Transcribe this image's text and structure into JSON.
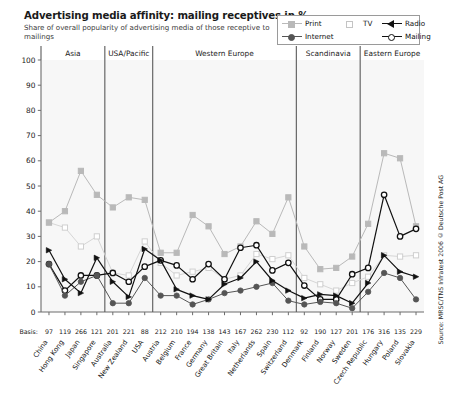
{
  "header": {
    "title": "Advertising media affinity: mailing receptives in %",
    "subtitle": "Share of overall popularity of advertising media of those receptive to mailings"
  },
  "source": "Source: MRSC/TNS Infratest 2006 © Deutsche Post AG",
  "basis_title": "Basis:",
  "legend": {
    "items": [
      {
        "label": "Print",
        "color": "#b9b9b9",
        "marker": "square",
        "filled": true
      },
      {
        "label": "TV",
        "color": "#d6d6d6",
        "marker": "square",
        "filled": false
      },
      {
        "label": "Radio",
        "color": "#111111",
        "marker": "triangle",
        "filled": true
      },
      {
        "label": "Internet",
        "color": "#555555",
        "marker": "circle",
        "filled": true
      },
      {
        "label": "Mailing",
        "color": "#111111",
        "marker": "circle",
        "filled": false
      }
    ]
  },
  "chart_data": {
    "type": "line",
    "title": "Advertising media affinity: mailing receptives in %",
    "subtitle": "Share of overall popularity of advertising media of those receptive to mailings",
    "xlabel": "",
    "ylabel": "",
    "ylim": [
      0,
      100
    ],
    "yticks": [
      0,
      10,
      20,
      30,
      40,
      50,
      60,
      70,
      80,
      90,
      100
    ],
    "grid": false,
    "legend_position": "top-right",
    "categories": [
      "China",
      "Hong Kong",
      "Japan",
      "Singapore",
      "Australia",
      "New Zealand",
      "USA",
      "Austria",
      "Belgium",
      "France",
      "Germany",
      "Great Britain",
      "Italy",
      "Netherlands",
      "Spain",
      "Switzerland",
      "Denmark",
      "Finland",
      "Norway",
      "Sweden",
      "Czech Republic",
      "Hungary",
      "Poland",
      "Slovakia"
    ],
    "basis": [
      97,
      119,
      266,
      121,
      201,
      221,
      88,
      212,
      210,
      194,
      138,
      143,
      167,
      262,
      230,
      112,
      92,
      190,
      127,
      201,
      176,
      316,
      135,
      229
    ],
    "regions": [
      {
        "label": "Asia",
        "start": 0,
        "end": 3
      },
      {
        "label": "USA/Pacific",
        "start": 4,
        "end": 6
      },
      {
        "label": "Western Europe",
        "start": 7,
        "end": 15
      },
      {
        "label": "Scandinavia",
        "start": 16,
        "end": 19
      },
      {
        "label": "Eastern Europe",
        "start": 20,
        "end": 23
      }
    ],
    "series": [
      {
        "name": "Print",
        "color": "#b9b9b9",
        "marker": "square",
        "filled": true,
        "values": [
          35.5,
          40,
          56,
          46.5,
          41.5,
          45.5,
          44.5,
          23.5,
          23.5,
          38.5,
          34,
          23,
          26,
          36,
          31,
          45.5,
          26,
          17,
          17.5,
          22,
          35,
          63,
          61,
          34
        ]
      },
      {
        "name": "TV",
        "color": "#d6d6d6",
        "marker": "square",
        "filled": false,
        "values": [
          35.5,
          33.5,
          26,
          30,
          15.5,
          14.5,
          28,
          19.5,
          14.5,
          16,
          17.5,
          13,
          14.5,
          23,
          21,
          22.5,
          13.5,
          11,
          8.5,
          11.5,
          14,
          22.5,
          22,
          22.5
        ]
      },
      {
        "name": "Radio",
        "color": "#111111",
        "marker": "triangle",
        "filled": true,
        "values": [
          24.5,
          13,
          7.5,
          21.5,
          12,
          6,
          25,
          20.5,
          9,
          6.5,
          5,
          11,
          13.5,
          20,
          12.5,
          8.5,
          5.5,
          7,
          6.5,
          3.5,
          11.5,
          22.5,
          16,
          14
        ]
      },
      {
        "name": "Internet",
        "color": "#555555",
        "marker": "circle",
        "filled": true,
        "values": [
          19,
          6.5,
          12,
          14.5,
          3.5,
          3.5,
          13.5,
          6.5,
          6.5,
          3,
          5,
          7.5,
          8.5,
          10,
          11.5,
          4.5,
          3,
          4,
          3.5,
          1.5,
          8,
          15.5,
          13.5,
          5
        ]
      },
      {
        "name": "Mailing",
        "color": "#111111",
        "marker": "circle",
        "filled": false,
        "values": [
          19,
          8.5,
          14.5,
          14.5,
          15.5,
          12,
          18,
          20.5,
          18.5,
          13,
          19,
          13,
          25.5,
          26.5,
          16.5,
          19.5,
          10.5,
          5,
          5,
          15,
          17.5,
          46.5,
          30,
          33
        ]
      }
    ]
  }
}
